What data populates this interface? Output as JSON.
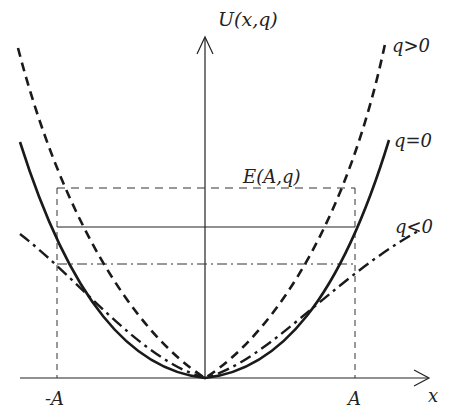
{
  "diagram": {
    "y_axis_label": "U(x,q)",
    "x_axis_label": "x",
    "tick_labels": {
      "neg_A": "-A",
      "pos_A": "A"
    },
    "energy_label": "E(A,q)",
    "curves": [
      {
        "name": "q>0",
        "label": "q>0",
        "style": "dashed"
      },
      {
        "name": "q=0",
        "label": "q=0",
        "style": "solid"
      },
      {
        "name": "q<0",
        "label": "q<0",
        "style": "dash-dot"
      }
    ],
    "colors": {
      "ink": "#1a1a1a",
      "background": "#ffffff"
    }
  }
}
